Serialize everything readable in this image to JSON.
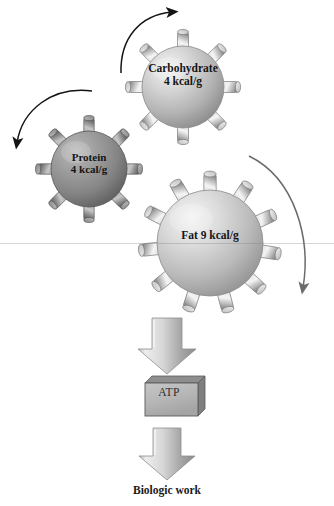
{
  "figure": {
    "background_color": "#ffffff",
    "width": 334,
    "height": 506
  },
  "molecules": [
    {
      "id": "carbohydrate",
      "name": "Carbohydrate",
      "energy": "4 kcal/g",
      "label": "Carbohydrate\n4 kcal/g",
      "center_x": 183,
      "center_y": 87,
      "radius": 44,
      "spikes": 8,
      "fill_light": "#d9d9d9",
      "fill_dark": "#9a9a9a",
      "shade": "light-gray"
    },
    {
      "id": "protein",
      "name": "Protein",
      "energy": "4 kcal/g",
      "label": "Protein\n4 kcal/g",
      "center_x": 89,
      "center_y": 169,
      "radius": 41,
      "spikes": 8,
      "fill_light": "#a8a8a8",
      "fill_dark": "#6a6a6a",
      "shade": "dark-gray"
    },
    {
      "id": "fat",
      "name": "Fat",
      "energy": "9 kcal/g",
      "label": "Fat 9 kcal/g",
      "center_x": 210,
      "center_y": 243,
      "radius": 58,
      "spikes": 11,
      "fill_light": "#dcdcdc",
      "fill_dark": "#9d9d9d",
      "shade": "light-gray"
    }
  ],
  "curved_arrows": [
    {
      "id": "carbohydrate-inflow-arrow",
      "name": "arrow-to-carbohydrate",
      "direction": "clockwise-up-right",
      "color": "#1c1c1c"
    },
    {
      "id": "protein-inflow-arrow",
      "name": "arrow-to-protein",
      "direction": "counterclockwise-down-left",
      "color": "#1c1c1c"
    },
    {
      "id": "fat-outflow-arrow",
      "name": "arrow-around-fat",
      "direction": "clockwise-down-right",
      "color": "#6f6f6f"
    }
  ],
  "flow": {
    "arrow_top": {
      "name": "down-arrow-to-atp",
      "fill_light": "#e6e6e6",
      "fill_dark": "#909090"
    },
    "atp_box": {
      "name": "ATP",
      "label": "ATP",
      "face_color": "#b9b9b9",
      "top_color": "#8e8e8e",
      "side_color": "#7f7f7f",
      "border_color": "#5a5a5a"
    },
    "arrow_bottom": {
      "name": "down-arrow-to-biologic-work",
      "fill_light": "#e6e6e6",
      "fill_dark": "#909090"
    },
    "caption": "Biologic work"
  },
  "artifacts": {
    "scanline_y": 243
  }
}
